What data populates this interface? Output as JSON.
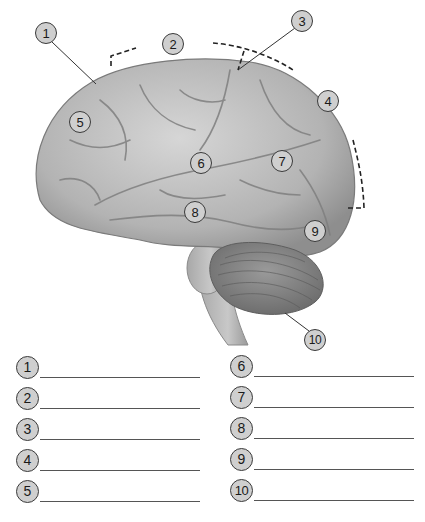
{
  "diagram": {
    "callouts": [
      {
        "n": "1",
        "x": 35,
        "y": 22
      },
      {
        "n": "2",
        "x": 162,
        "y": 33
      },
      {
        "n": "3",
        "x": 291,
        "y": 10
      },
      {
        "n": "4",
        "x": 317,
        "y": 90
      },
      {
        "n": "5",
        "x": 69,
        "y": 111
      },
      {
        "n": "6",
        "x": 190,
        "y": 152
      },
      {
        "n": "7",
        "x": 271,
        "y": 150
      },
      {
        "n": "8",
        "x": 184,
        "y": 201
      },
      {
        "n": "9",
        "x": 304,
        "y": 220
      },
      {
        "n": "10",
        "x": 304,
        "y": 329
      }
    ],
    "colors": {
      "callout_fill": "#cfcfcf",
      "callout_stroke": "#3a3a3a",
      "brain": "#b8b8b8",
      "brain_shadow": "#8a8a8a",
      "cerebellum": "#8c8c8c"
    }
  },
  "answer_blanks": {
    "left": [
      {
        "n": "1",
        "value": ""
      },
      {
        "n": "2",
        "value": ""
      },
      {
        "n": "3",
        "value": ""
      },
      {
        "n": "4",
        "value": ""
      },
      {
        "n": "5",
        "value": ""
      }
    ],
    "right": [
      {
        "n": "6",
        "value": ""
      },
      {
        "n": "7",
        "value": ""
      },
      {
        "n": "8",
        "value": ""
      },
      {
        "n": "9",
        "value": ""
      },
      {
        "n": "10",
        "value": ""
      }
    ]
  }
}
